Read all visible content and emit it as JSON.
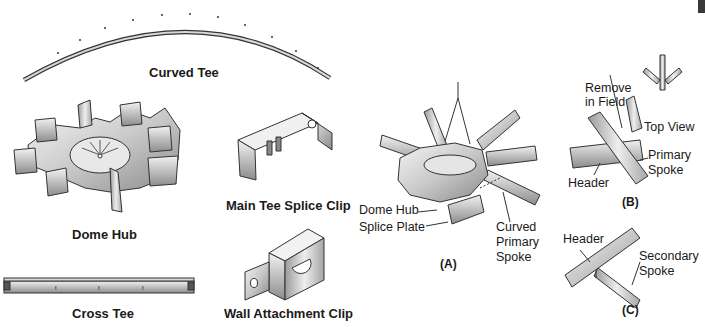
{
  "parts": {
    "curved_tee": "Curved Tee",
    "dome_hub": "Dome Hub",
    "main_tee_splice_clip": "Main Tee Splice Clip",
    "cross_tee": "Cross Tee",
    "wall_attachment_clip": "Wall Attachment Clip"
  },
  "figure_a": {
    "caption": "(A)",
    "callouts": {
      "dome_hub": "Dome Hub",
      "splice_plate": "Splice Plate",
      "curved_primary_spoke": [
        "Curved",
        "Primary",
        "Spoke"
      ]
    }
  },
  "figure_b": {
    "caption": "(B)",
    "callouts": {
      "remove_in_field": [
        "Remove",
        "in Field"
      ],
      "top_view": "Top View",
      "primary_spoke": [
        "Primary",
        "Spoke"
      ],
      "header": "Header"
    }
  },
  "figure_c": {
    "caption": "(C)",
    "callouts": {
      "header": "Header",
      "secondary_spoke": [
        "Secondary",
        "Spoke"
      ]
    }
  },
  "colors": {
    "metal_light": "#e6e6e6",
    "metal_mid": "#bdbdbd",
    "metal_dark": "#7a7a7a",
    "outline": "#333333",
    "corner_block": "#3a3a3a"
  }
}
